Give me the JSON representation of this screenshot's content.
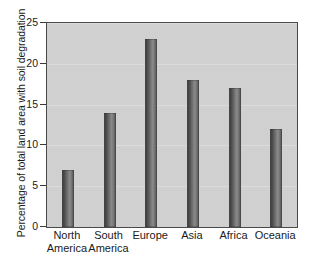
{
  "chart_data": {
    "type": "bar",
    "title": "",
    "subtitle": "",
    "xlabel": "",
    "ylabel": "Percentage of total land area with soil degradation",
    "categories": [
      "North America",
      "South America",
      "Europe",
      "Asia",
      "Africa",
      "Oceania"
    ],
    "category_lines": [
      [
        "North",
        "America"
      ],
      [
        "South",
        "America"
      ],
      [
        "Europe",
        ""
      ],
      [
        "Asia",
        ""
      ],
      [
        "Africa",
        ""
      ],
      [
        "Oceania",
        ""
      ]
    ],
    "values": [
      7,
      14,
      23,
      18,
      17,
      12
    ],
    "ylim": [
      0,
      25
    ],
    "yticks": [
      0,
      5,
      10,
      15,
      20,
      25
    ],
    "ytick_labels": [
      "0",
      "5",
      "10",
      "15",
      "20",
      "25"
    ],
    "grid": true,
    "legend": false,
    "legend_position": "none",
    "colors": {
      "plot_background": "#d2d2d2",
      "bar_fill": "#5a5a5a",
      "axis": "#4a4a4a",
      "text": "#1a1a1a",
      "gridline": "#e2e2e2",
      "page_background": "#ffffff"
    }
  }
}
